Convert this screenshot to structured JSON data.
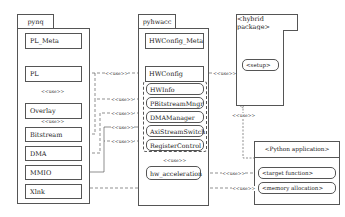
{
  "packages": {
    "pynq": {
      "name": "pynq",
      "classes": [
        "PL_Meta",
        "PL",
        "Overlay",
        "Bitstream",
        "DMA",
        "MMIO",
        "Xlnk"
      ]
    },
    "pyhwacc": {
      "name": "pyhwacc",
      "classes": [
        "HWConfig_Meta",
        "HWConfig"
      ],
      "grouped_components": [
        "HWInfo",
        "PBitstreamMngr",
        "DMAManager",
        "AxiStreamSwitch",
        "RegisterControl"
      ],
      "hw_acceleration": "hw_acceleration"
    },
    "hybrid": {
      "name": "<hybrid package>",
      "items": [
        "<setup>"
      ]
    },
    "python_app": {
      "name": "<Python application>",
      "items": [
        "<target function>",
        "<memory allocation>"
      ]
    }
  },
  "relations": {
    "use_label": "<<use>>"
  }
}
